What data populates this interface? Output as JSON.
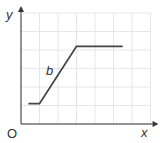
{
  "chart_data": {
    "type": "line",
    "title": "",
    "xlabel": "x",
    "ylabel": "y",
    "origin_label": "O",
    "grid": true,
    "axis_ranges": {
      "x": [
        0,
        7
      ],
      "y": [
        0,
        6
      ]
    },
    "xticks": [],
    "yticks": [],
    "legend": null,
    "series": [
      {
        "name": "b",
        "x": [
          0.4,
          1.0,
          3.0,
          5.5
        ],
        "y": [
          1.1,
          1.1,
          4.2,
          4.2
        ]
      }
    ],
    "annotations": [
      {
        "text": "b",
        "x": 1.6,
        "y": 2.8,
        "style": "italic"
      }
    ]
  },
  "colors": {
    "axis": "#333333",
    "line": "#444444",
    "grid": "#e6e6e6",
    "background": "#ffffff"
  },
  "layout": {
    "origin_px": [
      21,
      124
    ],
    "unit_px": 18.5
  }
}
